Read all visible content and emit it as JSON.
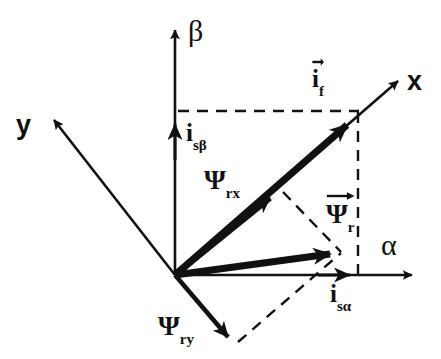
{
  "figure": {
    "background_color": "#ffffff",
    "stroke_color": "#111111"
  },
  "axes": [
    {
      "name": "beta-axis",
      "label": "β",
      "label_x": 188,
      "label_y": 18,
      "from": [
        175,
        275
      ],
      "to": [
        175,
        24
      ],
      "kind": "solid-thin"
    },
    {
      "name": "alpha-axis",
      "label": "α",
      "label_x": 383,
      "label_y": 232,
      "from": [
        175,
        275
      ],
      "to": [
        418,
        275
      ],
      "kind": "solid-thin"
    },
    {
      "name": "x-axis",
      "label": "x",
      "label_x": 408,
      "label_y": 68,
      "from": [
        175,
        275
      ],
      "to": [
        403,
        76
      ],
      "kind": "solid-thin"
    },
    {
      "name": "y-axis",
      "label": "y",
      "label_x": 16,
      "label_y": 112,
      "from": [
        175,
        275
      ],
      "to": [
        48,
        114
      ],
      "kind": "solid-thin"
    }
  ],
  "vectors": [
    {
      "name": "current-space-vector-if",
      "label_base": "i",
      "label_sub": "f",
      "has_overarrow": true,
      "label_x": 312,
      "label_y": 66,
      "from": [
        175,
        275
      ],
      "to": [
        355,
        118
      ],
      "kind": "thick"
    },
    {
      "name": "rotor-flux-vector-psir",
      "label_base": "Ψ",
      "label_sub": "r",
      "has_overarrow": true,
      "label_x": 326,
      "label_y": 200,
      "from": [
        175,
        275
      ],
      "to": [
        341,
        251
      ],
      "kind": "thick"
    },
    {
      "name": "rotor-flux-x-component-psirx",
      "label_base": "Ψ",
      "label_sub": "rx",
      "has_overarrow": false,
      "label_x": 204,
      "label_y": 166,
      "from": [
        175,
        275
      ],
      "to": [
        277,
        192
      ],
      "kind": "thick-marker-midpoint"
    },
    {
      "name": "rotor-flux-y-component-psiry",
      "label_base": "Ψ",
      "label_sub": "ry",
      "has_overarrow": false,
      "label_x": 158,
      "label_y": 312,
      "from": [
        175,
        275
      ],
      "to": [
        234,
        344
      ],
      "kind": "thick-thin"
    },
    {
      "name": "stator-current-beta-component-isbeta",
      "label_base": "i",
      "label_sub": "sβ",
      "has_overarrow": false,
      "label_x": 186,
      "label_y": 120,
      "from": [
        175,
        275
      ],
      "to": [
        175,
        114
      ],
      "kind": "component-marker"
    },
    {
      "name": "stator-current-alpha-component-isalpha",
      "label_base": "i",
      "label_sub": "sα",
      "has_overarrow": false,
      "label_x": 330,
      "label_y": 281,
      "from": [
        175,
        275
      ],
      "to": [
        357,
        275
      ],
      "kind": "component-marker"
    }
  ],
  "dashed_lines": [
    {
      "name": "projection-beta-horizontal",
      "from": [
        178,
        111
      ],
      "to": [
        359,
        111
      ]
    },
    {
      "name": "projection-alpha-vertical",
      "from": [
        358,
        112
      ],
      "to": [
        358,
        277
      ]
    },
    {
      "name": "projection-psirx-to-psir",
      "from": [
        281,
        191
      ],
      "to": [
        341,
        252
      ]
    },
    {
      "name": "projection-psiry-to-psir",
      "from": [
        237,
        343
      ],
      "to": [
        341,
        253
      ]
    }
  ],
  "labels": {
    "beta": "β",
    "alpha": "α",
    "x": "x",
    "y": "y",
    "i_f_base": "i",
    "i_f_sub": "f",
    "psi_r_base": "Ψ",
    "psi_r_sub": "r",
    "psi_rx_base": "Ψ",
    "psi_rx_sub": "rx",
    "psi_ry_base": "Ψ",
    "psi_ry_sub": "ry",
    "i_sbeta_base": "i",
    "i_sbeta_sub": "sβ",
    "i_salpha_base": "i",
    "i_salpha_sub": "sα"
  }
}
